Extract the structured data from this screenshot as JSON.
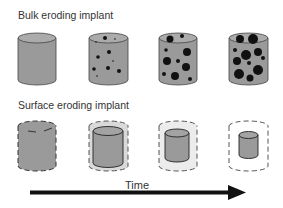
{
  "diagram": {
    "bulk_title": "Bulk eroding implant",
    "surface_title": "Surface eroding implant",
    "time_label": "Time",
    "colors": {
      "implant_fill": "#9a9a9a",
      "implant_top": "#b0b0b0",
      "pore": "#111111",
      "outline": "#333333",
      "halo": "#e6e6e6",
      "arrow": "#111111"
    },
    "bulk_stages": [
      "stage-1-intact",
      "stage-2-few-pores",
      "stage-3-more-pores",
      "stage-4-many-pores"
    ],
    "surface_stages": [
      "stage-1-full",
      "stage-2-shrinking",
      "stage-3-smaller",
      "stage-4-smallest"
    ]
  }
}
